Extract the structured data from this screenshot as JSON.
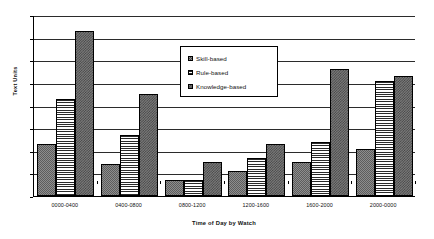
{
  "chart_data": {
    "type": "bar",
    "title": "",
    "xlabel": "Time of Day by Watch",
    "ylabel": "Text Units",
    "ylim": [
      0,
      80
    ],
    "ytick_step": 10,
    "yticks": [
      0,
      10,
      20,
      30,
      40,
      50,
      60,
      70,
      80
    ],
    "grid": true,
    "grid_axis": "y",
    "legend_position": "upper-center-inside",
    "categories": [
      "0000-0400",
      "0400-0800",
      "0800-1200",
      "1200-1600",
      "1600-2000",
      "2000-0000"
    ],
    "series": [
      {
        "name": "Skill-based",
        "values": [
          23,
          14,
          7,
          11,
          15,
          21
        ]
      },
      {
        "name": "Rule-based",
        "values": [
          43,
          27,
          7,
          17,
          24,
          51
        ]
      },
      {
        "name": "Knowledge-based",
        "values": [
          73,
          45,
          15,
          23,
          56,
          53
        ]
      }
    ]
  },
  "legend": {
    "items": [
      {
        "label": "Skill-based"
      },
      {
        "label": "Rule-based"
      },
      {
        "label": "Knowledge-based"
      }
    ]
  },
  "colors": {
    "axis": "#000000",
    "gridline": "#2b2b2b",
    "background": "#ffffff",
    "series_skill": "#8d8d8d",
    "series_rule": "#ffffff",
    "series_knowledge": "#7a7a7a"
  }
}
